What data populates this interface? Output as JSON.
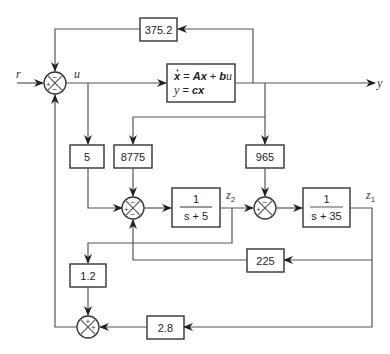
{
  "diagram": {
    "type": "block-diagram",
    "signals": {
      "input": "r",
      "control": "u",
      "output": "y",
      "state1": "z",
      "state1_sub": "1",
      "state2": "z",
      "state2_sub": "2"
    },
    "plant": {
      "line1_lhs": "x",
      "line1_eq": " = ",
      "line1_A": "A",
      "line1_x": "x",
      "line1_plus": " + ",
      "line1_b": "b",
      "line1_u": "u",
      "line2_y": "y",
      "line2_eq": " = ",
      "line2_cx": "cx"
    },
    "gains": {
      "top_feedback": "375.2",
      "u_gain": "5",
      "y_gain_left": "8775",
      "y_gain_right": "965",
      "z1_feedback": "225",
      "z2_gain": "1.2",
      "z1_gain": "2.8"
    },
    "transfer_functions": {
      "tf1": {
        "num": "1",
        "den": "s + 5"
      },
      "tf2": {
        "num": "1",
        "den": "s + 35"
      }
    },
    "junctions": {
      "main": {
        "top": "−",
        "left": "+",
        "bottom": "−"
      },
      "j2": {
        "top": "−",
        "left": "+",
        "bottom": "−"
      },
      "j3": {
        "top": "−",
        "left": "+"
      },
      "j4": {
        "top": "+",
        "right": "+"
      }
    }
  }
}
